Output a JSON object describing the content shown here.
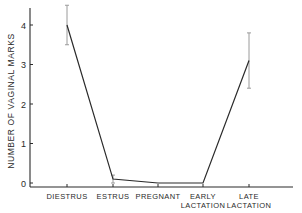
{
  "chart_data": {
    "type": "line",
    "title": "",
    "xlabel": "",
    "ylabel": "NUMBER OF VAGINAL MARKS",
    "categories": [
      "DIESTRUS",
      "ESTRUS",
      "PREGNANT",
      "EARLY LACTATION",
      "LATE LACTATION"
    ],
    "category_lines": [
      [
        "DIESTRUS"
      ],
      [
        "ESTRUS"
      ],
      [
        "PREGNANT"
      ],
      [
        "EARLY",
        "LACTATION"
      ],
      [
        "LATE",
        "LACTATION"
      ]
    ],
    "values": [
      4.0,
      0.1,
      0.0,
      0.0,
      3.1
    ],
    "error_bars": [
      {
        "low": 3.5,
        "high": 4.5
      },
      {
        "low": 0.0,
        "high": 0.2
      },
      null,
      null,
      {
        "low": 2.4,
        "high": 3.8
      }
    ],
    "yticks": [
      0,
      1,
      2,
      3,
      4
    ],
    "ylim": [
      0,
      4.3
    ],
    "grid": false,
    "legend": null
  },
  "colors": {
    "line": "#2a2a2a",
    "axis": "#2a2a2a",
    "error_bar": "#9a9a9a",
    "background": "#ffffff"
  }
}
